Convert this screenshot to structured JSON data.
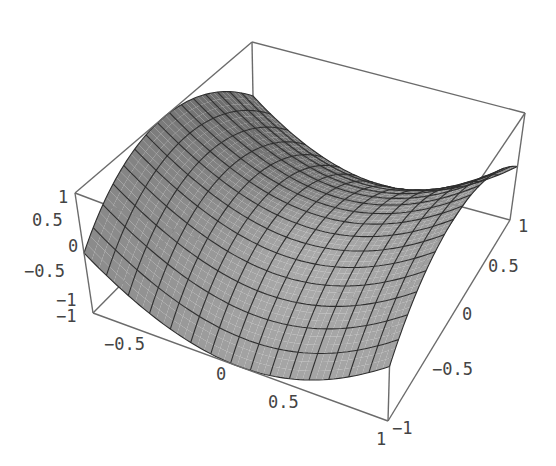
{
  "chart_data": {
    "type": "surface3d",
    "title": "",
    "function": "z = x^2 - y^2",
    "x_range": [
      -1,
      1
    ],
    "y_range": [
      -1,
      1
    ],
    "z_range": [
      -1,
      1
    ],
    "mesh_divisions": 15,
    "xlabel": "",
    "ylabel": "",
    "zlabel": "",
    "x_ticks": [
      "-1",
      "-0.5",
      "0",
      "0.5",
      "1"
    ],
    "y_ticks": [
      "-1",
      "-0.5",
      "0",
      "0.5",
      "1"
    ],
    "z_ticks": [
      "-1",
      "-0.5",
      "0",
      "0.5",
      "1"
    ],
    "boxed": true,
    "grid": false,
    "legend": null,
    "colors": {
      "surface": "#9a9a9a",
      "surface_dark": "#6e6e6e",
      "mesh": "#2e2e2e",
      "box": "#6b6b6b",
      "ticks": "#444444"
    }
  },
  "projection_corners": {
    "mmm": [
      93,
      313
    ],
    "pmm": [
      388,
      421
    ],
    "ppm": [
      510,
      220
    ],
    "mpm": [
      254,
      150
    ],
    "mmp": [
      75,
      193
    ],
    "pmp": [
      391,
      312
    ],
    "ppp": [
      525,
      113
    ],
    "mpp": [
      252,
      42
    ]
  },
  "tick_labels": {
    "z": [
      {
        "text": "1",
        "x": 58,
        "y": 203
      },
      {
        "text": "0.5",
        "x": 32,
        "y": 226
      },
      {
        "text": "0",
        "x": 68,
        "y": 252
      },
      {
        "text": "-0.5",
        "x": 24,
        "y": 277
      },
      {
        "text": "-1",
        "x": 56,
        "y": 306
      }
    ],
    "x": [
      {
        "text": "-1",
        "x": 56,
        "y": 322
      },
      {
        "text": "-0.5",
        "x": 104,
        "y": 350
      },
      {
        "text": "0",
        "x": 216,
        "y": 380
      },
      {
        "text": "0.5",
        "x": 268,
        "y": 408
      },
      {
        "text": "1",
        "x": 376,
        "y": 445
      }
    ],
    "y": [
      {
        "text": "-1",
        "x": 392,
        "y": 434
      },
      {
        "text": "-0.5",
        "x": 432,
        "y": 375
      },
      {
        "text": "0",
        "x": 462,
        "y": 320
      },
      {
        "text": "0.5",
        "x": 488,
        "y": 272
      },
      {
        "text": "1",
        "x": 518,
        "y": 232
      }
    ]
  }
}
